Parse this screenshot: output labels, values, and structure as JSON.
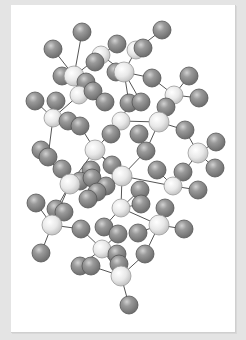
{
  "figure": {
    "colors": {
      "background": "#e4e4e4",
      "card": "#ffffff",
      "bond": "#555555",
      "light_atom": "#e6e6e6",
      "light_atom_edge": "#9a9a9a",
      "dark_atom": "#8c8c8c",
      "dark_atom_edge": "#555555"
    },
    "atoms": [
      {
        "id": "a1",
        "x": 82,
        "y": 32,
        "r": 9,
        "type": "dark"
      },
      {
        "id": "a2",
        "x": 162,
        "y": 30,
        "r": 9,
        "type": "dark"
      },
      {
        "id": "a3",
        "x": 53,
        "y": 49,
        "r": 9,
        "type": "dark"
      },
      {
        "id": "a4",
        "x": 117,
        "y": 44,
        "r": 9,
        "type": "dark"
      },
      {
        "id": "a5",
        "x": 101,
        "y": 55,
        "r": 9,
        "type": "light"
      },
      {
        "id": "a6",
        "x": 136,
        "y": 50,
        "r": 9,
        "type": "light"
      },
      {
        "id": "a7",
        "x": 143,
        "y": 48,
        "r": 9,
        "type": "dark"
      },
      {
        "id": "a8",
        "x": 95,
        "y": 62,
        "r": 9,
        "type": "dark"
      },
      {
        "id": "a9",
        "x": 62,
        "y": 76,
        "r": 9,
        "type": "dark"
      },
      {
        "id": "a10",
        "x": 74,
        "y": 76,
        "r": 10,
        "type": "light"
      },
      {
        "id": "a11",
        "x": 116,
        "y": 72,
        "r": 9,
        "type": "dark"
      },
      {
        "id": "a12",
        "x": 124,
        "y": 72,
        "r": 10,
        "type": "light"
      },
      {
        "id": "a13",
        "x": 152,
        "y": 78,
        "r": 9,
        "type": "dark"
      },
      {
        "id": "a14",
        "x": 189,
        "y": 76,
        "r": 9,
        "type": "dark"
      },
      {
        "id": "a15",
        "x": 86,
        "y": 82,
        "r": 9,
        "type": "dark"
      },
      {
        "id": "a16",
        "x": 79,
        "y": 95,
        "r": 9,
        "type": "light"
      },
      {
        "id": "a17",
        "x": 93,
        "y": 91,
        "r": 9,
        "type": "dark"
      },
      {
        "id": "a18",
        "x": 174,
        "y": 95,
        "r": 9,
        "type": "light"
      },
      {
        "id": "a19",
        "x": 199,
        "y": 98,
        "r": 9,
        "type": "dark"
      },
      {
        "id": "a20",
        "x": 35,
        "y": 101,
        "r": 9,
        "type": "dark"
      },
      {
        "id": "a21",
        "x": 56,
        "y": 101,
        "r": 9,
        "type": "dark"
      },
      {
        "id": "a22",
        "x": 105,
        "y": 102,
        "r": 9,
        "type": "dark"
      },
      {
        "id": "a23",
        "x": 129,
        "y": 103,
        "r": 9,
        "type": "dark"
      },
      {
        "id": "a24",
        "x": 141,
        "y": 102,
        "r": 9,
        "type": "dark"
      },
      {
        "id": "a25",
        "x": 166,
        "y": 107,
        "r": 9,
        "type": "dark"
      },
      {
        "id": "a26",
        "x": 53,
        "y": 118,
        "r": 9,
        "type": "light"
      },
      {
        "id": "a27",
        "x": 68,
        "y": 121,
        "r": 9,
        "type": "dark"
      },
      {
        "id": "a28",
        "x": 80,
        "y": 126,
        "r": 9,
        "type": "dark"
      },
      {
        "id": "a29",
        "x": 121,
        "y": 121,
        "r": 9,
        "type": "light"
      },
      {
        "id": "a30",
        "x": 159,
        "y": 122,
        "r": 10,
        "type": "light"
      },
      {
        "id": "a31",
        "x": 185,
        "y": 130,
        "r": 9,
        "type": "dark"
      },
      {
        "id": "a32",
        "x": 111,
        "y": 134,
        "r": 9,
        "type": "dark"
      },
      {
        "id": "a33",
        "x": 139,
        "y": 134,
        "r": 9,
        "type": "dark"
      },
      {
        "id": "a34",
        "x": 95,
        "y": 150,
        "r": 10,
        "type": "light"
      },
      {
        "id": "a35",
        "x": 41,
        "y": 150,
        "r": 9,
        "type": "dark"
      },
      {
        "id": "a36",
        "x": 48,
        "y": 157,
        "r": 9,
        "type": "dark"
      },
      {
        "id": "a37",
        "x": 146,
        "y": 151,
        "r": 9,
        "type": "dark"
      },
      {
        "id": "a38",
        "x": 198,
        "y": 153,
        "r": 10,
        "type": "light"
      },
      {
        "id": "a39",
        "x": 216,
        "y": 142,
        "r": 9,
        "type": "dark"
      },
      {
        "id": "a40",
        "x": 62,
        "y": 169,
        "r": 9,
        "type": "dark"
      },
      {
        "id": "a41",
        "x": 91,
        "y": 170,
        "r": 9,
        "type": "dark"
      },
      {
        "id": "a42",
        "x": 112,
        "y": 165,
        "r": 9,
        "type": "dark"
      },
      {
        "id": "a43",
        "x": 157,
        "y": 170,
        "r": 9,
        "type": "dark"
      },
      {
        "id": "a44",
        "x": 215,
        "y": 168,
        "r": 9,
        "type": "dark"
      },
      {
        "id": "a45",
        "x": 122,
        "y": 176,
        "r": 10,
        "type": "light"
      },
      {
        "id": "a46",
        "x": 183,
        "y": 172,
        "r": 9,
        "type": "dark"
      },
      {
        "id": "a47",
        "x": 80,
        "y": 181,
        "r": 9,
        "type": "dark"
      },
      {
        "id": "a48",
        "x": 92,
        "y": 178,
        "r": 9,
        "type": "dark"
      },
      {
        "id": "a49",
        "x": 70,
        "y": 184,
        "r": 10,
        "type": "light"
      },
      {
        "id": "a50",
        "x": 173,
        "y": 186,
        "r": 9,
        "type": "light"
      },
      {
        "id": "a51",
        "x": 198,
        "y": 190,
        "r": 9,
        "type": "dark"
      },
      {
        "id": "a52",
        "x": 106,
        "y": 186,
        "r": 9,
        "type": "dark"
      },
      {
        "id": "a53",
        "x": 97,
        "y": 192,
        "r": 9,
        "type": "dark"
      },
      {
        "id": "a54",
        "x": 140,
        "y": 190,
        "r": 9,
        "type": "dark"
      },
      {
        "id": "a55",
        "x": 36,
        "y": 203,
        "r": 9,
        "type": "dark"
      },
      {
        "id": "a56",
        "x": 56,
        "y": 209,
        "r": 9,
        "type": "dark"
      },
      {
        "id": "a57",
        "x": 64,
        "y": 212,
        "r": 9,
        "type": "dark"
      },
      {
        "id": "a58",
        "x": 88,
        "y": 199,
        "r": 9,
        "type": "dark"
      },
      {
        "id": "a59",
        "x": 121,
        "y": 208,
        "r": 9,
        "type": "light"
      },
      {
        "id": "a60",
        "x": 141,
        "y": 204,
        "r": 9,
        "type": "dark"
      },
      {
        "id": "a61",
        "x": 165,
        "y": 208,
        "r": 9,
        "type": "dark"
      },
      {
        "id": "a62",
        "x": 52,
        "y": 225,
        "r": 10,
        "type": "light"
      },
      {
        "id": "a63",
        "x": 81,
        "y": 229,
        "r": 9,
        "type": "dark"
      },
      {
        "id": "a64",
        "x": 104,
        "y": 227,
        "r": 9,
        "type": "dark"
      },
      {
        "id": "a65",
        "x": 118,
        "y": 234,
        "r": 9,
        "type": "dark"
      },
      {
        "id": "a66",
        "x": 138,
        "y": 233,
        "r": 9,
        "type": "dark"
      },
      {
        "id": "a67",
        "x": 159,
        "y": 225,
        "r": 10,
        "type": "light"
      },
      {
        "id": "a68",
        "x": 184,
        "y": 229,
        "r": 9,
        "type": "dark"
      },
      {
        "id": "a69",
        "x": 41,
        "y": 253,
        "r": 9,
        "type": "dark"
      },
      {
        "id": "a70",
        "x": 102,
        "y": 249,
        "r": 9,
        "type": "light"
      },
      {
        "id": "a71",
        "x": 117,
        "y": 254,
        "r": 9,
        "type": "dark"
      },
      {
        "id": "a72",
        "x": 145,
        "y": 254,
        "r": 9,
        "type": "dark"
      },
      {
        "id": "a73",
        "x": 80,
        "y": 266,
        "r": 9,
        "type": "dark"
      },
      {
        "id": "a74",
        "x": 91,
        "y": 266,
        "r": 9,
        "type": "dark"
      },
      {
        "id": "a75",
        "x": 119,
        "y": 264,
        "r": 9,
        "type": "dark"
      },
      {
        "id": "a76",
        "x": 121,
        "y": 276,
        "r": 10,
        "type": "light"
      },
      {
        "id": "a77",
        "x": 129,
        "y": 305,
        "r": 9,
        "type": "dark"
      }
    ],
    "bonds": [
      [
        "a1",
        "a10"
      ],
      [
        "a3",
        "a10"
      ],
      [
        "a4",
        "a5"
      ],
      [
        "a5",
        "a10"
      ],
      [
        "a5",
        "a12"
      ],
      [
        "a6",
        "a12"
      ],
      [
        "a2",
        "a6"
      ],
      [
        "a12",
        "a13"
      ],
      [
        "a12",
        "a11"
      ],
      [
        "a12",
        "a23"
      ],
      [
        "a12",
        "a24"
      ],
      [
        "a13",
        "a18"
      ],
      [
        "a14",
        "a18"
      ],
      [
        "a18",
        "a19"
      ],
      [
        "a10",
        "a16"
      ],
      [
        "a16",
        "a26"
      ],
      [
        "a16",
        "a22"
      ],
      [
        "a16",
        "a15"
      ],
      [
        "a20",
        "a26"
      ],
      [
        "a21",
        "a26"
      ],
      [
        "a26",
        "a36"
      ],
      [
        "a23",
        "a29"
      ],
      [
        "a29",
        "a34"
      ],
      [
        "a29",
        "a30"
      ],
      [
        "a30",
        "a25"
      ],
      [
        "a30",
        "a31"
      ],
      [
        "a30",
        "a37"
      ],
      [
        "a34",
        "a28"
      ],
      [
        "a34",
        "a42"
      ],
      [
        "a34",
        "a45"
      ],
      [
        "a34",
        "a49"
      ],
      [
        "a35",
        "a49"
      ],
      [
        "a45",
        "a37"
      ],
      [
        "a45",
        "a52"
      ],
      [
        "a45",
        "a50"
      ],
      [
        "a38",
        "a31"
      ],
      [
        "a38",
        "a39"
      ],
      [
        "a38",
        "a44"
      ],
      [
        "a38",
        "a50"
      ],
      [
        "a50",
        "a43"
      ],
      [
        "a50",
        "a51"
      ],
      [
        "a49",
        "a47"
      ],
      [
        "a49",
        "a40"
      ],
      [
        "a49",
        "a62"
      ],
      [
        "a49",
        "a56"
      ],
      [
        "a45",
        "a59"
      ],
      [
        "a59",
        "a54"
      ],
      [
        "a59",
        "a60"
      ],
      [
        "a59",
        "a64"
      ],
      [
        "a59",
        "a67"
      ],
      [
        "a67",
        "a61"
      ],
      [
        "a67",
        "a68"
      ],
      [
        "a67",
        "a66"
      ],
      [
        "a67",
        "a72"
      ],
      [
        "a62",
        "a55"
      ],
      [
        "a62",
        "a63"
      ],
      [
        "a62",
        "a69"
      ],
      [
        "a63",
        "a70"
      ],
      [
        "a70",
        "a65"
      ],
      [
        "a70",
        "a73"
      ],
      [
        "a70",
        "a76"
      ],
      [
        "a76",
        "a74"
      ],
      [
        "a76",
        "a75"
      ],
      [
        "a76",
        "a72"
      ],
      [
        "a76",
        "a77"
      ]
    ]
  }
}
